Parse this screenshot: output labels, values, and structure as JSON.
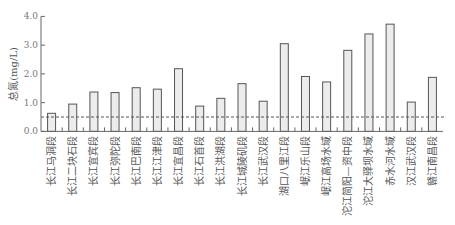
{
  "chart_data": {
    "type": "bar",
    "title": "",
    "xlabel": "",
    "ylabel": "总氮(mg/L)",
    "ylim": [
      0,
      4.0
    ],
    "yticks": [
      "0.0",
      "1.0",
      "2.0",
      "3.0",
      "4.0"
    ],
    "grid": false,
    "legend": null,
    "categories": [
      "长江马洞段",
      "长江二块石段",
      "长江宜宾段",
      "长江弥陀段",
      "长江巴南段",
      "长江江津段",
      "长江宜昌段",
      "长江石首段",
      "长江洪湖段",
      "长江城陵矶段",
      "长江武汉段",
      "湖口八里江段",
      "岷江乐山段",
      "岷江高场水域",
      "沱江简阳—资中段",
      "沱江大驿坝水域",
      "赤水河水域",
      "汉江武汉段",
      "赣江南昌段"
    ],
    "values": [
      0.63,
      0.95,
      1.37,
      1.35,
      1.52,
      1.47,
      2.18,
      0.88,
      1.15,
      1.66,
      1.05,
      3.05,
      1.91,
      1.72,
      2.82,
      3.39,
      3.73,
      1.02,
      1.88
    ],
    "reference_line": {
      "value": 0.5,
      "style": "dashed",
      "label": ""
    },
    "colors": {
      "bar_fill": "#ececec",
      "bar_stroke": "#555555",
      "axis": "#666666",
      "reference": "#555555"
    }
  }
}
